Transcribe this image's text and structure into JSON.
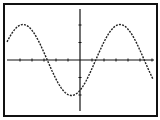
{
  "screen": {
    "background": "#ffffff",
    "frame_color": "#111111",
    "curve_color": "#222222",
    "axis_color": "#111111"
  },
  "chart_data": {
    "type": "line",
    "title": "",
    "xlabel": "",
    "ylabel": "",
    "function": "y = -2 sin(x)",
    "x_ticks": [
      -5,
      -4,
      -3,
      -2,
      -1,
      0,
      1,
      2,
      3,
      4,
      5,
      6
    ],
    "y_ticks": [
      -2,
      -1,
      0,
      1,
      2
    ],
    "xlim": [
      -6.28,
      6.28
    ],
    "ylim": [
      -3.1,
      3.1
    ],
    "grid": false,
    "series": [
      {
        "name": "curve",
        "style": "dotted",
        "x": [
          -6.3,
          -5.5,
          -4.71,
          -3.9,
          -3.14,
          -2.4,
          -1.57,
          -0.8,
          0,
          0.8,
          1.57,
          2.4,
          3.14,
          3.9,
          4.71,
          5.5,
          6.3
        ],
        "y": [
          -0.6,
          1.5,
          2.0,
          1.4,
          0.0,
          -1.4,
          -2.0,
          -1.4,
          -0.3,
          1.1,
          2.0,
          1.6,
          0.3,
          -1.2,
          -1.9,
          -1.3,
          0.1
        ]
      }
    ]
  }
}
